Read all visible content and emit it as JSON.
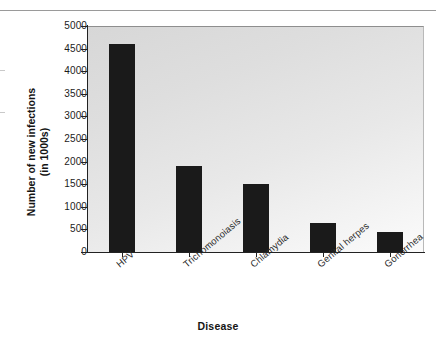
{
  "figure": {
    "background_color": "#ffffff",
    "plot_background_light": "#fbfbfb",
    "plot_background_dark": "#d7d7d7",
    "bar_color": "#1a1a1a",
    "axis_color": "#222222",
    "top_rule_color": "#9a9a9a"
  },
  "chart_data": {
    "type": "bar",
    "title": "",
    "xlabel": "Disease",
    "ylabel_line1": "Number of new infections",
    "ylabel_line2": "(in 1000s)",
    "categories": [
      "HPV",
      "Trichomonoiasis",
      "Chlamydia",
      "Genital herpes",
      "Gonorrhea"
    ],
    "values": [
      4600,
      1900,
      1500,
      650,
      440
    ],
    "ylim": [
      0,
      5000
    ],
    "yticks": [
      0,
      500,
      1000,
      1500,
      2000,
      2500,
      3000,
      3500,
      4000,
      4500,
      5000
    ],
    "ytick_labels": [
      "0",
      "500",
      "1000",
      "1500",
      "2000",
      "2500",
      "3000",
      "3500",
      "4000",
      "4500",
      "5000"
    ],
    "grid": false,
    "legend": false,
    "legend_position": "none",
    "xtick_label_rotation": -40
  }
}
